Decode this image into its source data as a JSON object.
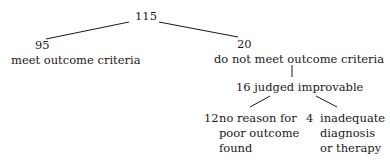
{
  "tree": {
    "root": {
      "count": "115"
    },
    "left": {
      "count": "95",
      "label": "meet outcome criteria"
    },
    "right": {
      "count": "20",
      "label": "do not meet outcome criteria"
    },
    "improvable": {
      "label": "16 judged improvable"
    },
    "leaf_left": {
      "count": "12",
      "lines": [
        "no reason for",
        "poor outcome",
        "found"
      ]
    },
    "leaf_right": {
      "count": "4",
      "lines": [
        "inadequate",
        "diagnosis",
        "or therapy"
      ]
    }
  },
  "colors": {
    "text": "#1a1a1a",
    "lines": "#1a1a1a",
    "background": "#ffffff"
  }
}
